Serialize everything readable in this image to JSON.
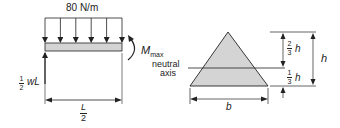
{
  "beam_diagram": {
    "load_label": "80 N/m",
    "moment_label": "M",
    "moment_subscript": "max",
    "reaction_fraction_num": "1",
    "reaction_fraction_den": "2",
    "reaction_label": "wL",
    "length_num": "L",
    "length_den": "2",
    "load_arrow_count": 6
  },
  "section_diagram": {
    "neutral_axis_label_line1": "neutral",
    "neutral_axis_label_line2": "axis",
    "base_label": "b",
    "height_label": "h",
    "upper_dim_num": "2",
    "upper_dim_den": "3",
    "upper_dim_var": "h",
    "lower_dim_num": "1",
    "lower_dim_den": "3",
    "lower_dim_var": "h"
  },
  "colors": {
    "line": "#222222",
    "fill": "#d4d4d4"
  }
}
